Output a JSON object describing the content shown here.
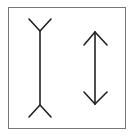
{
  "figure": {
    "colors": {
      "line": "#222222",
      "frame": "#777777",
      "background": "#ffffff"
    },
    "frame": {
      "x": 8,
      "y": 7,
      "width": 117,
      "height": 121
    },
    "left_figure": {
      "name": "fins-out",
      "shaft": {
        "x": 40,
        "y1": 31,
        "y2": 105
      },
      "top_fins": [
        [
          29,
          19
        ],
        [
          51,
          19
        ]
      ],
      "bottom_fins": [
        [
          29,
          117
        ],
        [
          51,
          117
        ]
      ]
    },
    "right_figure": {
      "name": "double-arrow",
      "shaft": {
        "x": 95,
        "y1": 32,
        "y2": 104
      },
      "top_head": [
        [
          84,
          45
        ],
        [
          107,
          45
        ]
      ],
      "bottom_head": [
        [
          84,
          92
        ],
        [
          107,
          92
        ]
      ]
    }
  }
}
